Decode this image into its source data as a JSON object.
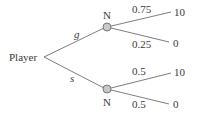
{
  "tree": {
    "root": {
      "label": "Player"
    },
    "actions": [
      {
        "label": "g",
        "node": "N",
        "outcomes": [
          {
            "prob": "0.75",
            "payoff": "10"
          },
          {
            "prob": "0.25",
            "payoff": "0"
          }
        ]
      },
      {
        "label": "s",
        "node": "N",
        "outcomes": [
          {
            "prob": "0.5",
            "payoff": "10"
          },
          {
            "prob": "0.5",
            "payoff": "0"
          }
        ]
      }
    ]
  },
  "colors": {
    "line": "#6e6e6e",
    "node_fill": "#c8c8c8",
    "text": "#3a3a3a"
  }
}
